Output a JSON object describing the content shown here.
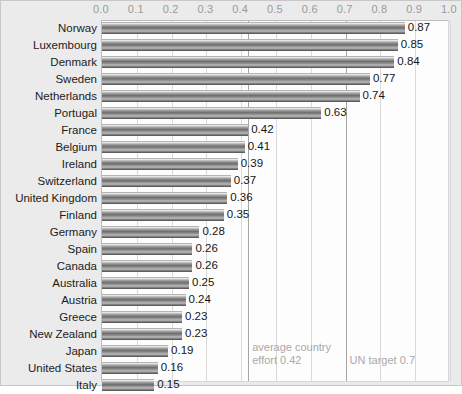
{
  "chart_data": {
    "type": "bar",
    "orientation": "horizontal",
    "title": "",
    "xlabel": "",
    "ylabel": "",
    "xlim": [
      0.0,
      1.0
    ],
    "grid": true,
    "axis_position": "top",
    "legend": "none",
    "tick_labels": [
      "0.0",
      "0.1",
      "0.2",
      "0.3",
      "0.4",
      "0.5",
      "0.6",
      "0.7",
      "0.8",
      "0.9",
      "1.0"
    ],
    "ticks": [
      0.0,
      0.1,
      0.2,
      0.3,
      0.4,
      0.5,
      0.6,
      0.7,
      0.8,
      0.9,
      1.0
    ],
    "categories": [
      "Norway",
      "Luxembourg",
      "Denmark",
      "Sweden",
      "Netherlands",
      "Portugal",
      "France",
      "Belgium",
      "Ireland",
      "Switzerland",
      "United Kingdom",
      "Finland",
      "Germany",
      "Spain",
      "Canada",
      "Australia",
      "Austria",
      "Greece",
      "New Zealand",
      "Japan",
      "United States",
      "Italy"
    ],
    "values": [
      0.87,
      0.85,
      0.84,
      0.77,
      0.74,
      0.63,
      0.42,
      0.41,
      0.39,
      0.37,
      0.36,
      0.35,
      0.28,
      0.26,
      0.26,
      0.25,
      0.24,
      0.23,
      0.23,
      0.19,
      0.16,
      0.15
    ],
    "value_labels": [
      "0.87",
      "0.85",
      "0.84",
      "0.77",
      "0.74",
      "0.63",
      "0.42",
      "0.41",
      "0.39",
      "0.37",
      "0.36",
      "0.35",
      "0.28",
      "0.26",
      "0.26",
      "0.25",
      "0.24",
      "0.23",
      "0.23",
      "0.19",
      "0.16",
      "0.15"
    ],
    "reference_lines": [
      {
        "value": 0.42,
        "label": "average country\neffort 0.42"
      },
      {
        "value": 0.7,
        "label": "UN target 0.7"
      }
    ],
    "colors": {
      "bar": "#7a7a7a",
      "plot_background": "#fdfdfd",
      "figure_background": "#ebebeb",
      "gridline": "#dadada",
      "reference_line": "#a5a5a5",
      "tick_label": "#9a9a9a",
      "annotation": "#a9a9a9",
      "value_label": "#161616",
      "category_label": "#1b1b1b"
    }
  }
}
